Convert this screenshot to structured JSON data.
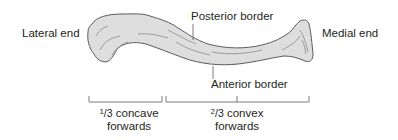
{
  "figure": {
    "labels": {
      "lateral_end": "Lateral end",
      "medial_end": "Medial end",
      "posterior_border": "Posterior border",
      "anterior_border": "Anterior border"
    },
    "segments": [
      {
        "numerator": "1",
        "denominator": "/3",
        "line1_rest": " concave",
        "line2": "forwards"
      },
      {
        "numerator": "2",
        "denominator": "/3",
        "line1_rest": " convex",
        "line2": "forwards"
      }
    ],
    "colors": {
      "bone_fill": "#dcdcdc",
      "bone_outline": "#5a5a5a",
      "text": "#231f20",
      "lines": "#6d6d6d"
    }
  }
}
